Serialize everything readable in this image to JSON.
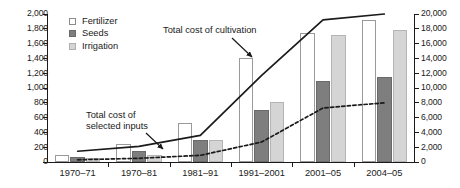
{
  "chart_data": {
    "type": "bar",
    "title": "",
    "xlabel": "",
    "ylabel": "",
    "categories": [
      "1970–71",
      "1970–81",
      "1981–91",
      "1991–2001",
      "2001–05",
      "2004–05"
    ],
    "left_axis": {
      "ylim": [
        0,
        2000
      ],
      "ticks": [
        0,
        200,
        400,
        600,
        800,
        1000,
        1200,
        1400,
        1600,
        1800,
        2000
      ],
      "tick_labels": [
        "0",
        "200",
        "400",
        "600",
        "800",
        "1,000",
        "1,200",
        "1,400",
        "1,600",
        "1,800",
        "2,000"
      ]
    },
    "right_axis": {
      "ylim": [
        0,
        20000
      ],
      "ticks": [
        0,
        2000,
        4000,
        6000,
        8000,
        10000,
        12000,
        14000,
        16000,
        18000,
        20000
      ],
      "tick_labels": [
        "0",
        "2,000",
        "4,000",
        "6,000",
        "8,000",
        "10,000",
        "12,000",
        "14,000",
        "16,000",
        "18,000",
        "20,000"
      ]
    },
    "grid": false,
    "legend_position": "top-left",
    "series": [
      {
        "name": "Fertilizer",
        "axis": "left",
        "style": "bar",
        "color": "#ffffff",
        "values": [
          100,
          250,
          530,
          1400,
          1750,
          1920
        ]
      },
      {
        "name": "Seeds",
        "axis": "left",
        "style": "bar",
        "color": "#7e7e7e",
        "values": [
          70,
          145,
          295,
          700,
          1090,
          1150
        ]
      },
      {
        "name": "Irrigation",
        "axis": "left",
        "style": "bar",
        "color": "#d5d5d5",
        "values": [
          55,
          100,
          300,
          810,
          1720,
          1780
        ]
      },
      {
        "name": "Total cost of cultivation",
        "axis": "right",
        "style": "line-solid",
        "color": "#1a1a1a",
        "values": [
          1450,
          2100,
          3600,
          11700,
          19200,
          20000
        ]
      },
      {
        "name": "Total cost of selected inputs",
        "axis": "right",
        "style": "line-dashed",
        "color": "#1a1a1a",
        "values": [
          300,
          500,
          900,
          2700,
          7300,
          8000
        ]
      }
    ],
    "annotations": [
      {
        "name": "Total cost of cultivation",
        "text_lines": [
          "Total cost of cultivation"
        ]
      },
      {
        "name": "Total cost of selected inputs",
        "text_lines": [
          "Total cost of",
          "selected inputs"
        ]
      }
    ]
  },
  "legend": {
    "items": [
      {
        "label": "Fertilizer"
      },
      {
        "label": "Seeds"
      },
      {
        "label": "Irrigation"
      }
    ]
  },
  "annotations": {
    "cultivation": "Total cost of cultivation",
    "inputs_line1": "Total cost of",
    "inputs_line2": "selected inputs"
  },
  "colors": {
    "fertilizer": "#ffffff",
    "seeds": "#7e7e7e",
    "irrigation": "#d5d5d5",
    "axis": "#1a1a1a",
    "line": "#1a1a1a"
  }
}
